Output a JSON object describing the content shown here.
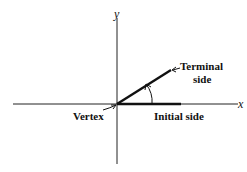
{
  "diagram": {
    "axes": {
      "x_label": "x",
      "y_label": "y"
    },
    "labels": {
      "terminal_line1": "Terminal",
      "terminal_line2": "side",
      "initial": "Initial side",
      "vertex": "Vertex"
    },
    "colors": {
      "line": "#111111",
      "background": "#ffffff"
    }
  }
}
